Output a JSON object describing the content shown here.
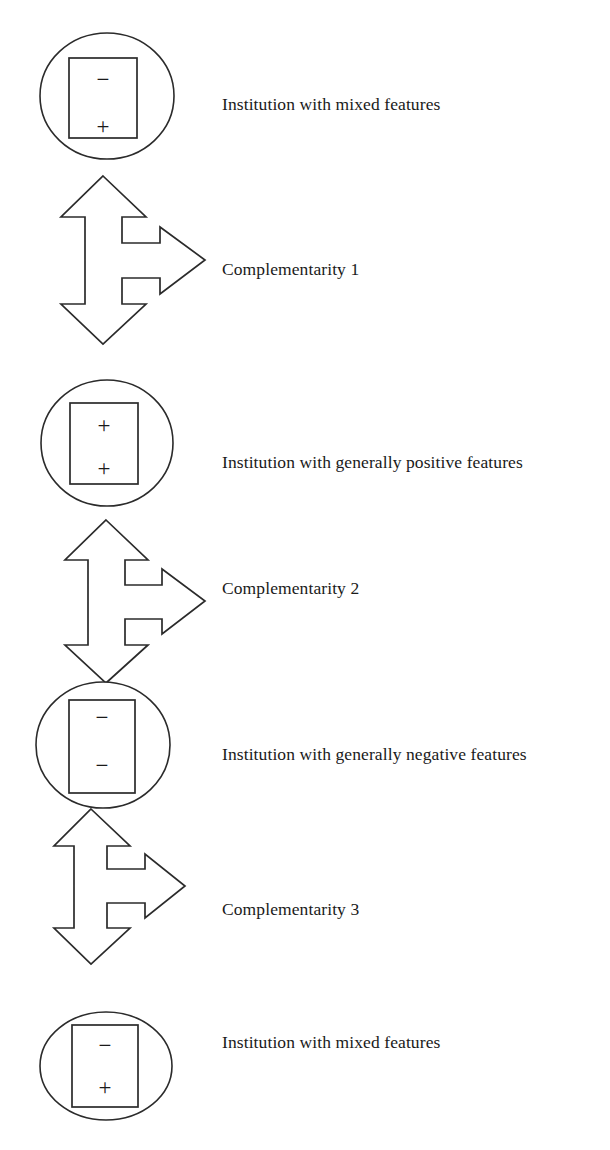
{
  "figure": {
    "type": "diagram",
    "kind": "vertical-chain-flow",
    "background_color": "#ffffff",
    "stroke_color": "#2b2b2b",
    "text_color": "#1a1a1a"
  },
  "nodes": [
    {
      "id": "node-1",
      "shape": "ellipse",
      "label": "Institution with mixed features",
      "signs": [
        "−",
        "+"
      ],
      "label_top": 94
    },
    {
      "id": "node-2",
      "shape": "ellipse",
      "label": "Institution with generally positive features",
      "signs": [
        "+",
        "+"
      ],
      "label_top": 452
    },
    {
      "id": "node-3",
      "shape": "ellipse",
      "label": "Institution with generally negative features",
      "signs": [
        "−",
        "−"
      ],
      "label_top": 744
    },
    {
      "id": "node-4",
      "shape": "ellipse",
      "label": "Institution with mixed features",
      "signs": [
        "−",
        "+"
      ],
      "label_top": 1032
    }
  ],
  "connectors": [
    {
      "id": "connector-1",
      "shape": "three-way-arrow",
      "directions": [
        "up",
        "down",
        "right"
      ],
      "label": "Complementarity 1",
      "label_top": 259
    },
    {
      "id": "connector-2",
      "shape": "three-way-arrow",
      "directions": [
        "up",
        "down",
        "right"
      ],
      "label": "Complementarity 2",
      "label_top": 578
    },
    {
      "id": "connector-3",
      "shape": "three-way-arrow",
      "directions": [
        "up",
        "down",
        "right"
      ],
      "label": "Complementarity 3",
      "label_top": 899
    }
  ]
}
